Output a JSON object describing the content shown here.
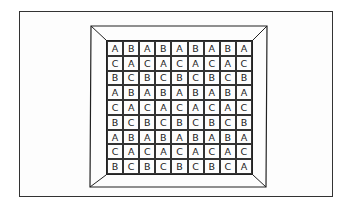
{
  "figure": {
    "grid": [
      [
        "A",
        "B",
        "A",
        "B",
        "A",
        "B",
        "A",
        "B",
        "A"
      ],
      [
        "C",
        "A",
        "C",
        "A",
        "C",
        "A",
        "C",
        "A",
        "C"
      ],
      [
        "B",
        "C",
        "B",
        "C",
        "B",
        "C",
        "B",
        "C",
        "B"
      ],
      [
        "A",
        "B",
        "A",
        "B",
        "A",
        "B",
        "A",
        "B",
        "A"
      ],
      [
        "C",
        "A",
        "C",
        "A",
        "C",
        "A",
        "C",
        "A",
        "C"
      ],
      [
        "B",
        "C",
        "B",
        "C",
        "B",
        "C",
        "B",
        "C",
        "B"
      ],
      [
        "A",
        "B",
        "A",
        "B",
        "A",
        "B",
        "A",
        "B",
        "A"
      ],
      [
        "C",
        "A",
        "C",
        "A",
        "C",
        "A",
        "C",
        "A",
        "C"
      ],
      [
        "B",
        "C",
        "B",
        "C",
        "B",
        "C",
        "B",
        "C",
        "A"
      ]
    ],
    "colors": {
      "ink": "#222222",
      "background": "#ffffff"
    }
  }
}
